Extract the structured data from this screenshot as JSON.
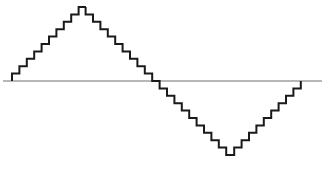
{
  "diagram": {
    "type": "stepped-sine-wave",
    "colors": {
      "background": "#ffffff",
      "wave": "#1a1a1a",
      "axis": "#707070"
    },
    "axis": {
      "x1": 3,
      "x2": 322,
      "y": 81
    },
    "wave": {
      "start_x": 12,
      "baseline_y": 81,
      "step_width": 7.4,
      "step_height": 7.4,
      "steps_per_quarter": 10,
      "peak_plateau_width": 7,
      "trough_plateau_width": 8,
      "end_x": 313
    }
  }
}
